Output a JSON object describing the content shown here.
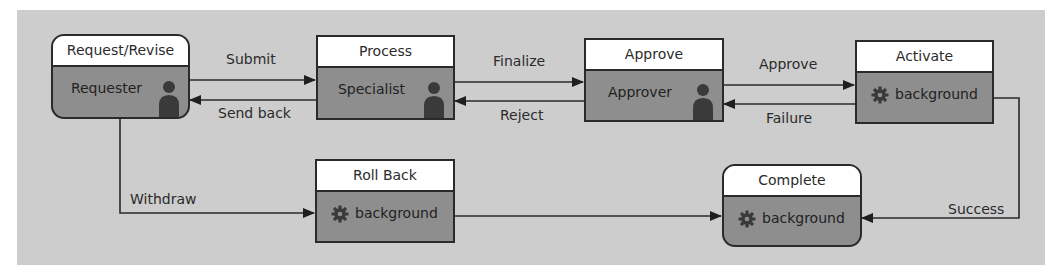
{
  "diagram": {
    "colors": {
      "canvas": "#cdcdcd",
      "node_body": "#8e8e8e",
      "node_header": "#ffffff",
      "stroke": "#2a2a2a"
    },
    "nodes": [
      {
        "id": "request",
        "title": "Request/Revise",
        "label": "Requester",
        "icon": "person-icon",
        "shape": "rounded"
      },
      {
        "id": "process",
        "title": "Process",
        "label": "Specialist",
        "icon": "person-icon",
        "shape": "rect"
      },
      {
        "id": "approve",
        "title": "Approve",
        "label": "Approver",
        "icon": "person-icon",
        "shape": "rect"
      },
      {
        "id": "activate",
        "title": "Activate",
        "label": "background",
        "icon": "gear-icon",
        "shape": "rect"
      },
      {
        "id": "rollback",
        "title": "Roll Back",
        "label": "background",
        "icon": "gear-icon",
        "shape": "rect"
      },
      {
        "id": "complete",
        "title": "Complete",
        "label": "background",
        "icon": "gear-icon",
        "shape": "rounded"
      }
    ],
    "edges": [
      {
        "from": "request",
        "to": "process",
        "label": "Submit"
      },
      {
        "from": "process",
        "to": "request",
        "label": "Send back"
      },
      {
        "from": "process",
        "to": "approve",
        "label": "Finalize"
      },
      {
        "from": "approve",
        "to": "process",
        "label": "Reject"
      },
      {
        "from": "approve",
        "to": "activate",
        "label": "Approve"
      },
      {
        "from": "activate",
        "to": "approve",
        "label": "Failure"
      },
      {
        "from": "request",
        "to": "rollback",
        "label": "Withdraw"
      },
      {
        "from": "rollback",
        "to": "complete",
        "label": ""
      },
      {
        "from": "activate",
        "to": "complete",
        "label": "Success"
      }
    ]
  }
}
